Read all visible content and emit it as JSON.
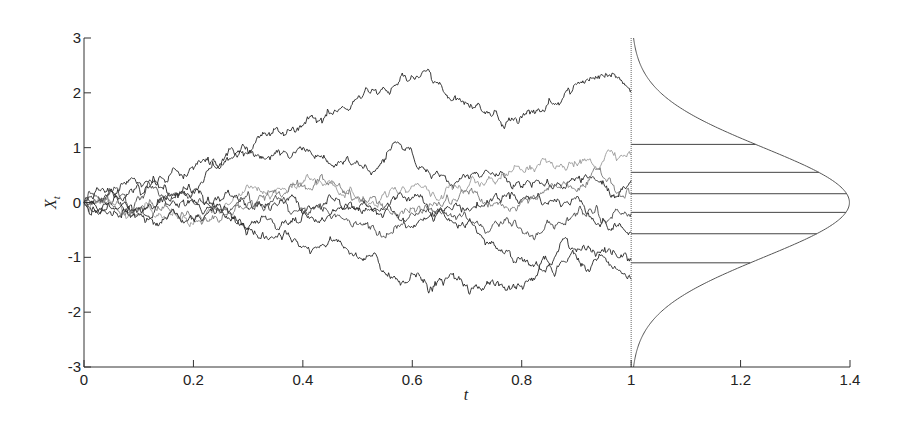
{
  "chart_data": {
    "type": "line",
    "title": "",
    "xlabel": "t",
    "ylabel": "X_t",
    "xlim": [
      0,
      1.4
    ],
    "ylim": [
      -3,
      3
    ],
    "grid": false,
    "legend": null,
    "x_ticks": [
      0,
      0.2,
      0.4,
      0.6,
      0.8,
      1,
      1.2,
      1.4
    ],
    "x_tick_labels": [
      "0",
      "0.2",
      "0.4",
      "0.6",
      "0.8",
      "1",
      "1.2",
      "1.4"
    ],
    "y_ticks": [
      -3,
      -2,
      -1,
      0,
      1,
      2,
      3
    ],
    "y_tick_labels": [
      "-3",
      "-2",
      "-1",
      "0",
      "1",
      "2",
      "3"
    ],
    "series": [
      {
        "name": "path-1",
        "color": "#222222",
        "anchors_t": [
          0,
          0.1,
          0.2,
          0.3,
          0.4,
          0.5,
          0.6,
          0.7,
          0.77,
          0.85,
          0.95,
          1.0
        ],
        "anchors_x": [
          0,
          0.3,
          0.6,
          0.9,
          1.4,
          1.9,
          2.3,
          1.8,
          1.4,
          1.9,
          2.3,
          2.05
        ]
      },
      {
        "name": "path-2",
        "color": "#222222",
        "anchors_t": [
          0,
          0.1,
          0.2,
          0.3,
          0.4,
          0.5,
          0.6,
          0.7,
          0.8,
          0.9,
          1.0
        ],
        "anchors_x": [
          0,
          -0.1,
          0.2,
          0.9,
          1.0,
          0.75,
          0.9,
          0.5,
          0.3,
          0.45,
          0.4
        ]
      },
      {
        "name": "path-3",
        "color": "#999999",
        "anchors_t": [
          0,
          0.1,
          0.2,
          0.3,
          0.4,
          0.5,
          0.6,
          0.7,
          0.8,
          0.9,
          1.0
        ],
        "anchors_x": [
          0,
          -0.2,
          -0.4,
          0.3,
          0.35,
          0.1,
          0.3,
          0.25,
          0.6,
          0.7,
          0.88
        ]
      },
      {
        "name": "path-4",
        "color": "#222222",
        "anchors_t": [
          0,
          0.1,
          0.2,
          0.3,
          0.4,
          0.5,
          0.6,
          0.7,
          0.8,
          0.9,
          1.0
        ],
        "anchors_x": [
          0,
          0.35,
          0.2,
          -0.1,
          -0.2,
          -0.1,
          0.1,
          -0.1,
          0.05,
          0.1,
          -0.55
        ]
      },
      {
        "name": "path-5",
        "color": "#777777",
        "anchors_t": [
          0,
          0.1,
          0.2,
          0.3,
          0.4,
          0.5,
          0.6,
          0.7,
          0.8,
          0.9,
          1.0
        ],
        "anchors_x": [
          0,
          -0.1,
          -0.3,
          0.0,
          0.3,
          0.1,
          -0.1,
          0.2,
          0.0,
          0.2,
          0.15
        ]
      },
      {
        "name": "path-6",
        "color": "#222222",
        "anchors_t": [
          0,
          0.1,
          0.2,
          0.3,
          0.4,
          0.5,
          0.6,
          0.7,
          0.8,
          0.9,
          1.0
        ],
        "anchors_x": [
          0,
          -0.1,
          0.0,
          -0.5,
          -0.2,
          -0.1,
          -0.45,
          -0.4,
          -1.0,
          -0.9,
          -1.05
        ]
      },
      {
        "name": "path-7",
        "color": "#222222",
        "anchors_t": [
          0,
          0.1,
          0.2,
          0.3,
          0.4,
          0.5,
          0.6,
          0.7,
          0.77,
          0.85,
          0.95,
          1.0
        ],
        "anchors_x": [
          0,
          -0.2,
          -0.3,
          -0.5,
          -0.8,
          -1.0,
          -1.3,
          -1.5,
          -1.6,
          -1.1,
          -1.0,
          -1.4
        ]
      },
      {
        "name": "path-8",
        "color": "#444444",
        "anchors_t": [
          0,
          0.1,
          0.2,
          0.3,
          0.4,
          0.5,
          0.6,
          0.7,
          0.8,
          0.9,
          1.0
        ],
        "anchors_x": [
          0,
          0.1,
          0.0,
          0.2,
          -0.1,
          -0.4,
          -0.2,
          -0.3,
          -0.5,
          -0.2,
          -0.2
        ]
      }
    ],
    "density": {
      "distribution": "normal",
      "mean": 0,
      "std": 1,
      "baseline_t": 1,
      "scale": 1.0
    },
    "endpoint_lines_x": [
      1.06,
      0.55,
      0.16,
      -0.18,
      -0.57,
      -1.1
    ]
  }
}
